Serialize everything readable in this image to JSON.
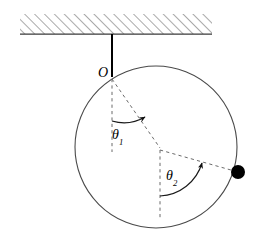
{
  "figure": {
    "type": "physics-diagram",
    "background_color": "#ffffff",
    "stroke_color": "#3a3a3a",
    "dash_color": "#6b6b6b",
    "solid_color": "#000000"
  },
  "ceiling": {
    "name": "hatched-ceiling",
    "x": 20,
    "y": 14,
    "width": 192,
    "height": 20,
    "baseline_y": 34,
    "hatch_direction": "up-right",
    "hatch_spacing": 7,
    "hatch_color": "#555555"
  },
  "rod": {
    "name": "support-rod",
    "x1": 112,
    "y1": 34,
    "x2": 112,
    "y2": 77,
    "color": "#000000",
    "width": 2
  },
  "circle": {
    "name": "constraint-circle",
    "cx": 156,
    "cy": 147,
    "r": 81,
    "color": "#4a4a4a",
    "width": 1.1
  },
  "pivot": {
    "name": "pivot-point",
    "label": "O",
    "x": 112,
    "y": 77
  },
  "elbow": {
    "name": "elbow-joint",
    "x": 160,
    "y": 148
  },
  "bob": {
    "name": "pendulum-bob",
    "x": 238,
    "y": 172,
    "r": 7,
    "color": "#000000"
  },
  "dashed_lines": [
    {
      "name": "vertical-reference-from-pivot",
      "x1": 112,
      "y1": 79,
      "x2": 112,
      "y2": 152
    },
    {
      "name": "first-link-pivot-to-elbow",
      "x1": 112,
      "y1": 79,
      "x2": 160,
      "y2": 148
    },
    {
      "name": "vertical-reference-from-elbow",
      "x1": 160,
      "y1": 150,
      "x2": 160,
      "y2": 218
    },
    {
      "name": "second-link-elbow-to-bob",
      "x1": 160,
      "y1": 150,
      "x2": 238,
      "y2": 172
    }
  ],
  "angles": [
    {
      "name": "angle-theta1",
      "symbol": "θ",
      "subscript": "1",
      "vertex_x": 112,
      "vertex_y": 79,
      "arc_radius": 42,
      "from_deg": 90,
      "to_deg": 55,
      "label_x": 112,
      "label_y": 128
    },
    {
      "name": "angle-theta2",
      "symbol": "θ",
      "subscript": "2",
      "vertex_x": 160,
      "vertex_y": 150,
      "arc_radius": 46,
      "from_deg": 90,
      "to_deg": 16,
      "label_x": 166,
      "label_y": 169
    }
  ]
}
